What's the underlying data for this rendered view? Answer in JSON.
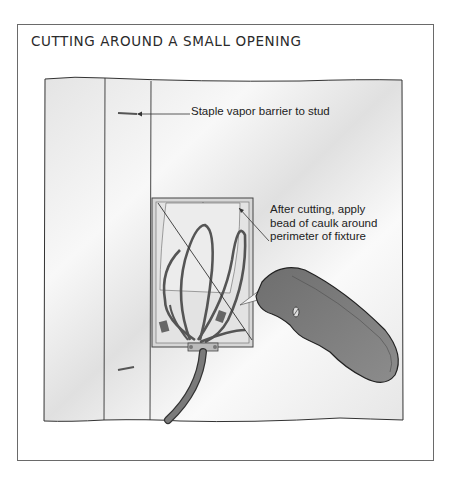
{
  "figure": {
    "title": "CUTTING AROUND A SMALL OPENING",
    "callouts": [
      {
        "id": "staple",
        "text": "Staple vapor barrier to stud"
      },
      {
        "id": "caulk",
        "lines": [
          "After cutting, apply",
          "bead of caulk around",
          "perimeter of fixture"
        ]
      }
    ],
    "elements": [
      "wall-with-vapor-barrier",
      "stud",
      "staple",
      "electrical-box",
      "wires",
      "cable",
      "utility-knife"
    ],
    "colors": {
      "frame": "#6a6a6a",
      "ink": "#333333",
      "knife": "#7a7a7a",
      "wall": "#f2f2f2"
    }
  }
}
